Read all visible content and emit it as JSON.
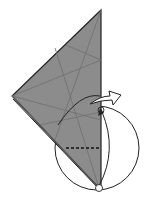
{
  "diagram": {
    "type": "origami-fold-step",
    "colors": {
      "paper": "#8c8c8c",
      "crease": "#6e6e6e",
      "outline": "#222222",
      "background": "#ffffff",
      "arrow_fill": "#ffffff"
    },
    "symbols": [
      "pivot-circle-top",
      "pivot-circle-bottom",
      "rotation-circle",
      "valley-fold-dashed-line",
      "open-arrow",
      "rotation-arrow"
    ]
  }
}
